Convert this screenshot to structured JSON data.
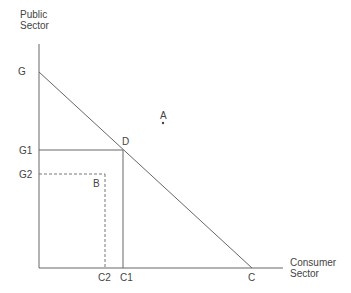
{
  "diagram": {
    "y_axis_title_line1": "Public",
    "y_axis_title_line2": "Sector",
    "x_axis_title_line1": "Consumer",
    "x_axis_title_line2": "Sector",
    "labels": {
      "G": "G",
      "G1": "G1",
      "G2": "G2",
      "C": "C",
      "C1": "C1",
      "C2": "C2",
      "A": "A",
      "B": "B",
      "D": "D"
    },
    "colors": {
      "line": "#555555",
      "text": "#444444"
    }
  }
}
